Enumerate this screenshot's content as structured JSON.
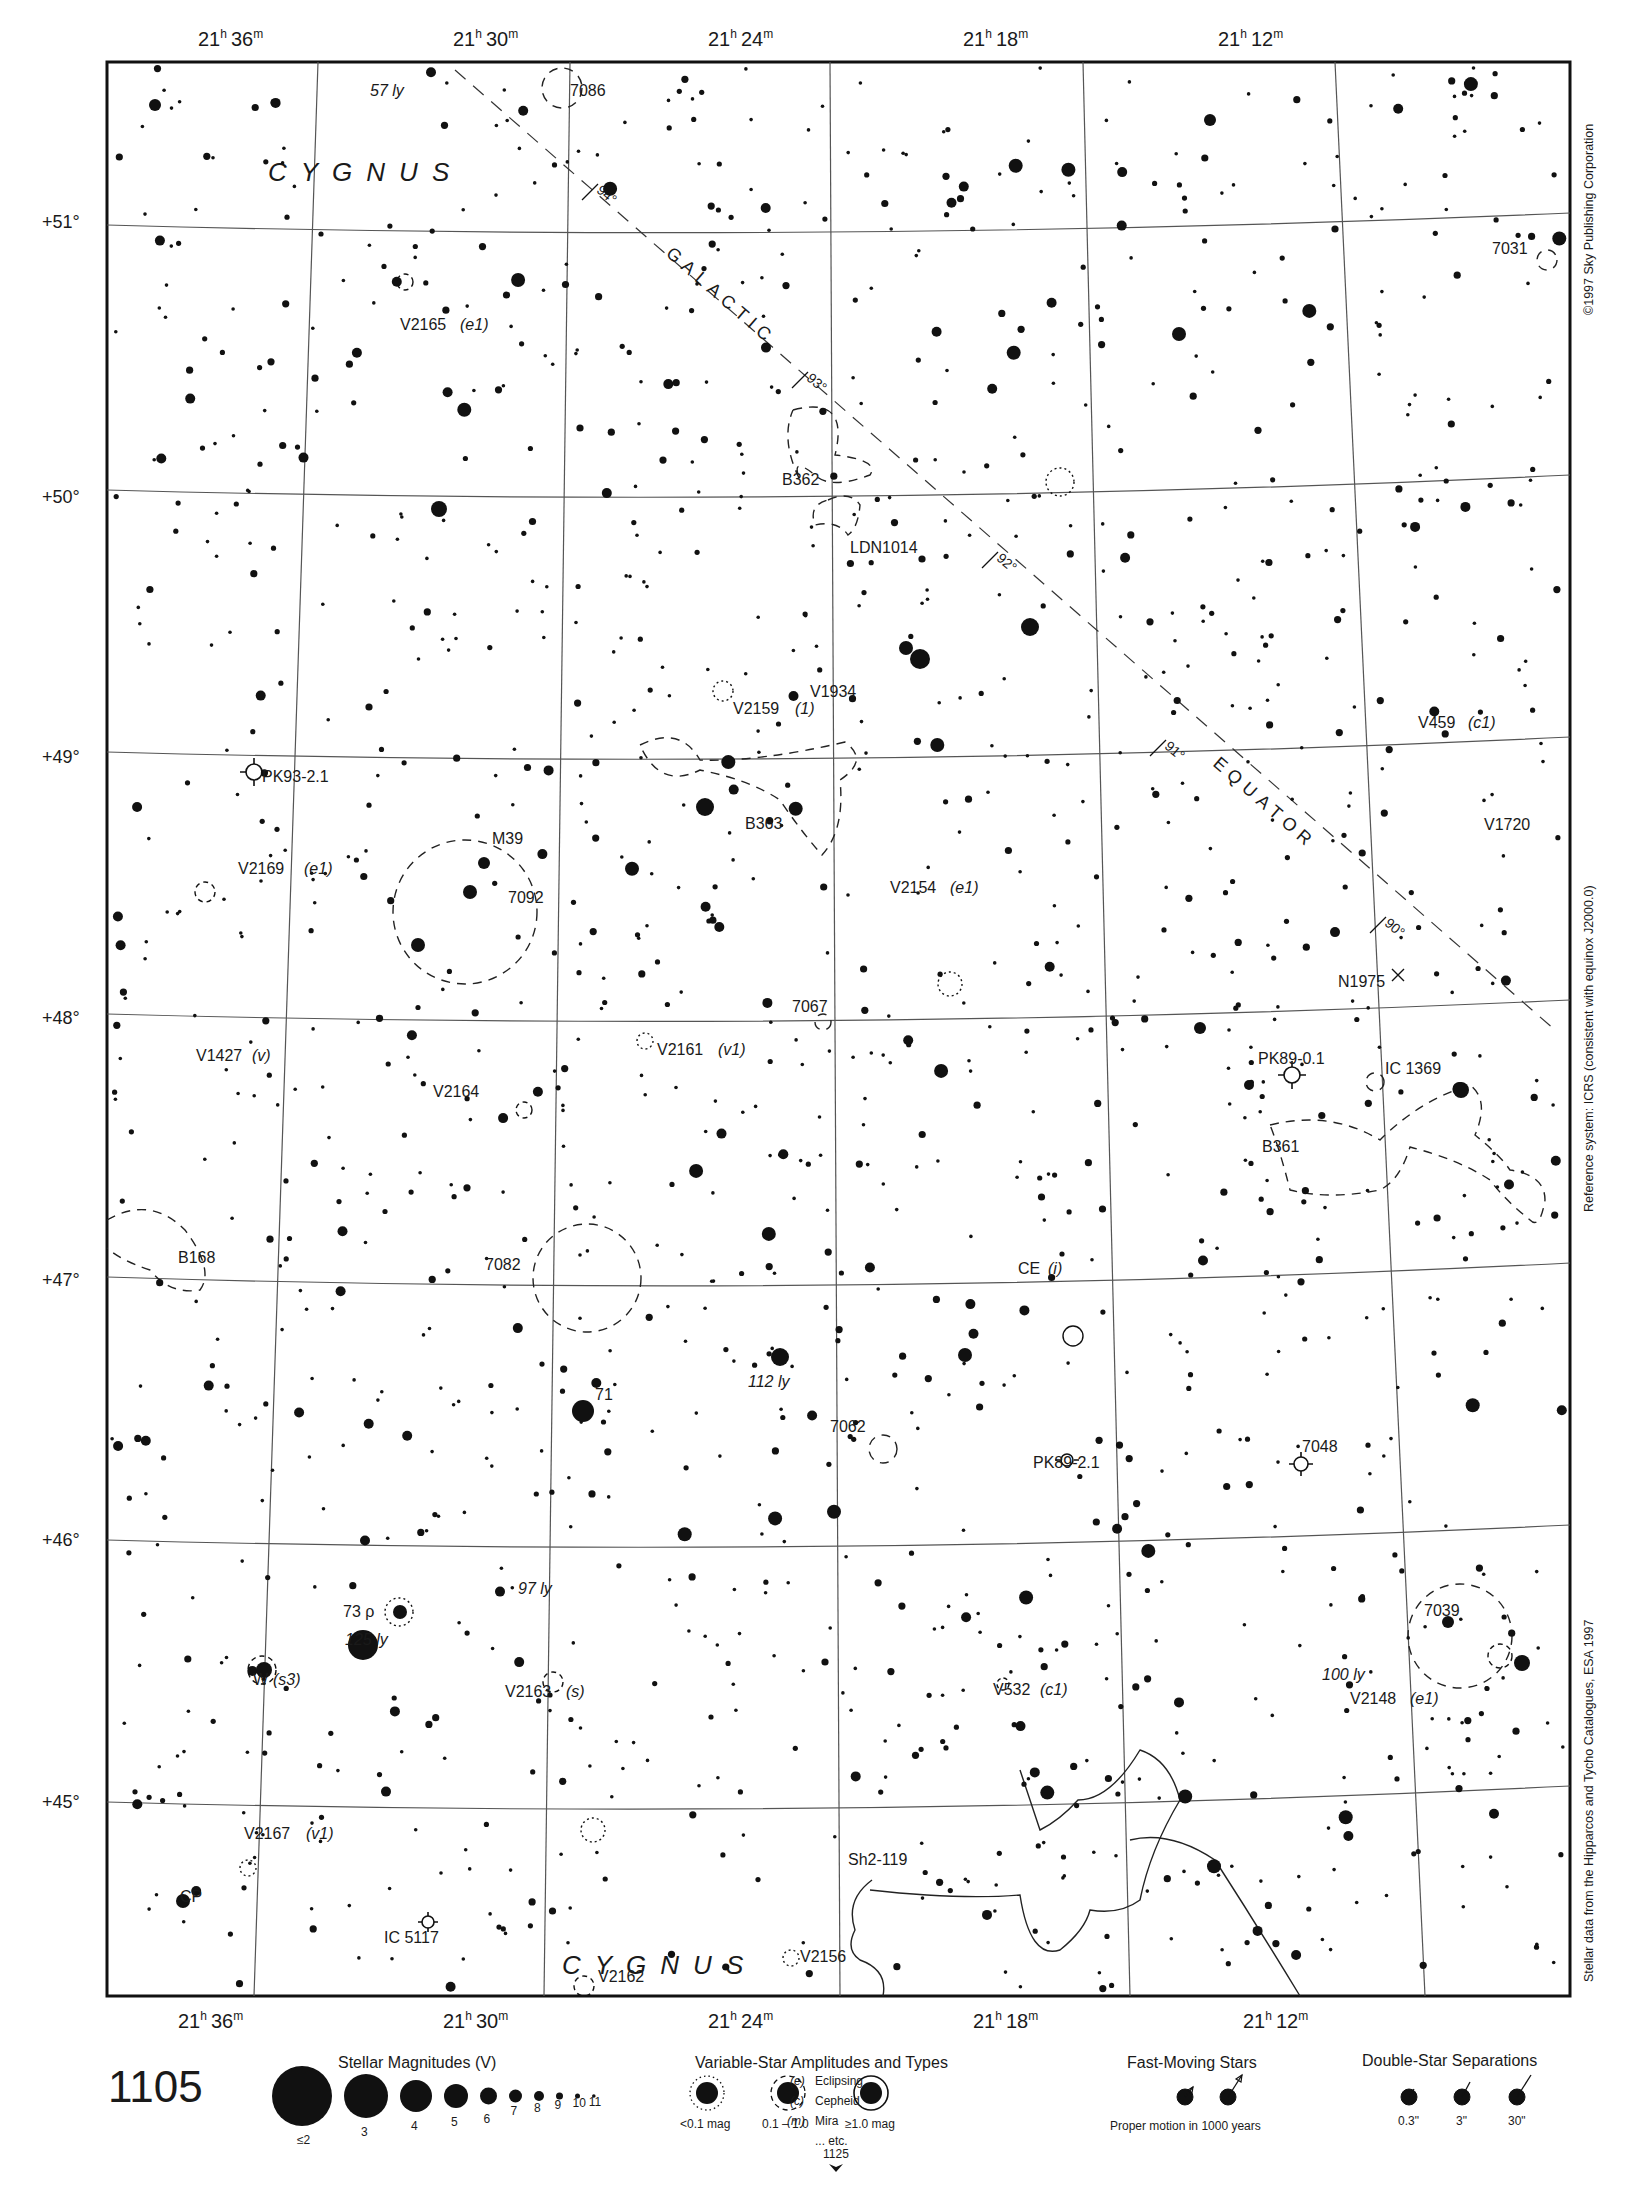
{
  "chart_info": {
    "page_number": "1105",
    "next_page_ref": "1125",
    "constellation": "CYGNUS",
    "galactic_label_1": "GALACTIC",
    "galactic_label_2": "EQUATOR",
    "copyright": "©1997 Sky Publishing Corporation",
    "reference_system": "Reference system: ICRS (consistent with equinox J2000.0)",
    "data_source": "Stellar data from the Hipparcos and Tycho Catalogues, ESA 1997"
  },
  "axes": {
    "ra_top": [
      {
        "label_h": "21",
        "label_m": "36",
        "x": 230
      },
      {
        "label_h": "21",
        "label_m": "30",
        "x": 485
      },
      {
        "label_h": "21",
        "label_m": "24",
        "x": 740
      },
      {
        "label_h": "21",
        "label_m": "18",
        "x": 995
      },
      {
        "label_h": "21",
        "label_m": "12",
        "x": 1250
      }
    ],
    "ra_bottom": [
      {
        "label_h": "21",
        "label_m": "36",
        "x": 210
      },
      {
        "label_h": "21",
        "label_m": "30",
        "x": 475
      },
      {
        "label_h": "21",
        "label_m": "24",
        "x": 740
      },
      {
        "label_h": "21",
        "label_m": "18",
        "x": 1005
      },
      {
        "label_h": "21",
        "label_m": "12",
        "x": 1275
      }
    ],
    "dec": [
      {
        "label": "+51°",
        "y": 222
      },
      {
        "label": "+50°",
        "y": 497
      },
      {
        "label": "+49°",
        "y": 757
      },
      {
        "label": "+48°",
        "y": 1018
      },
      {
        "label": "+47°",
        "y": 1280
      },
      {
        "label": "+46°",
        "y": 1540
      },
      {
        "label": "+45°",
        "y": 1802
      }
    ]
  },
  "labels": [
    {
      "id": "lbl-57ly",
      "text": "57 ly",
      "x": 370,
      "y": 96,
      "italic": true
    },
    {
      "id": "lbl-7086",
      "text": "7086",
      "x": 570,
      "y": 96
    },
    {
      "id": "lbl-v2165",
      "text": "V2165",
      "x": 400,
      "y": 330
    },
    {
      "id": "lbl-v2165-type",
      "text": "(e1)",
      "x": 460,
      "y": 330,
      "italic": true
    },
    {
      "id": "lbl-7031",
      "text": "7031",
      "x": 1492,
      "y": 254
    },
    {
      "id": "lbl-b362",
      "text": "B362",
      "x": 782,
      "y": 485
    },
    {
      "id": "lbl-ldn1014",
      "text": "LDN1014",
      "x": 850,
      "y": 553
    },
    {
      "id": "lbl-v1934",
      "text": "V1934",
      "x": 810,
      "y": 697
    },
    {
      "id": "lbl-v2159",
      "text": "V2159",
      "x": 733,
      "y": 714
    },
    {
      "id": "lbl-v2159-type",
      "text": "(1)",
      "x": 795,
      "y": 714,
      "italic": true
    },
    {
      "id": "lbl-v459",
      "text": "V459",
      "x": 1418,
      "y": 728
    },
    {
      "id": "lbl-v459-type",
      "text": "(c1)",
      "x": 1468,
      "y": 728,
      "italic": true
    },
    {
      "id": "lbl-pk93",
      "text": "PK93-2.1",
      "x": 262,
      "y": 782
    },
    {
      "id": "lbl-b363",
      "text": "B363",
      "x": 745,
      "y": 829
    },
    {
      "id": "lbl-v1720",
      "text": "V1720",
      "x": 1484,
      "y": 830
    },
    {
      "id": "lbl-m39",
      "text": "M39",
      "x": 492,
      "y": 844
    },
    {
      "id": "lbl-v2169",
      "text": "V2169",
      "x": 238,
      "y": 874
    },
    {
      "id": "lbl-v2169-type",
      "text": "(e1)",
      "x": 304,
      "y": 874,
      "italic": true
    },
    {
      "id": "lbl-7092",
      "text": "7092",
      "x": 508,
      "y": 903
    },
    {
      "id": "lbl-v2154",
      "text": "V2154",
      "x": 890,
      "y": 893
    },
    {
      "id": "lbl-v2154-type",
      "text": "(e1)",
      "x": 950,
      "y": 893,
      "italic": true
    },
    {
      "id": "lbl-n1975",
      "text": "N1975",
      "x": 1338,
      "y": 987
    },
    {
      "id": "lbl-7067",
      "text": "7067",
      "x": 792,
      "y": 1012
    },
    {
      "id": "lbl-v2161",
      "text": "V2161",
      "x": 657,
      "y": 1055
    },
    {
      "id": "lbl-v2161-type",
      "text": "(v1)",
      "x": 718,
      "y": 1055,
      "italic": true
    },
    {
      "id": "lbl-v1427",
      "text": "V1427",
      "x": 196,
      "y": 1061
    },
    {
      "id": "lbl-v1427-type",
      "text": "(v)",
      "x": 252,
      "y": 1061,
      "italic": true
    },
    {
      "id": "lbl-pk89-01",
      "text": "PK89-0.1",
      "x": 1258,
      "y": 1064
    },
    {
      "id": "lbl-ic1369",
      "text": "IC 1369",
      "x": 1385,
      "y": 1074
    },
    {
      "id": "lbl-v2164",
      "text": "V2164",
      "x": 433,
      "y": 1097
    },
    {
      "id": "lbl-b361",
      "text": "B361",
      "x": 1262,
      "y": 1152
    },
    {
      "id": "lbl-b168",
      "text": "B168",
      "x": 178,
      "y": 1263
    },
    {
      "id": "lbl-7082",
      "text": "7082",
      "x": 485,
      "y": 1270
    },
    {
      "id": "lbl-ce",
      "text": "CE",
      "x": 1018,
      "y": 1274
    },
    {
      "id": "lbl-ce-type",
      "text": "(i)",
      "x": 1048,
      "y": 1274,
      "italic": true
    },
    {
      "id": "lbl-112ly",
      "text": "112 ly",
      "x": 748,
      "y": 1387,
      "italic": true
    },
    {
      "id": "lbl-71",
      "text": "71",
      "x": 595,
      "y": 1400
    },
    {
      "id": "lbl-7062",
      "text": "7062",
      "x": 830,
      "y": 1432
    },
    {
      "id": "lbl-7048",
      "text": "7048",
      "x": 1302,
      "y": 1452
    },
    {
      "id": "lbl-pk89-21",
      "text": "PK89-2.1",
      "x": 1033,
      "y": 1468
    },
    {
      "id": "lbl-97ly",
      "text": "97 ly",
      "x": 518,
      "y": 1594,
      "italic": true
    },
    {
      "id": "lbl-7039",
      "text": "7039",
      "x": 1424,
      "y": 1616
    },
    {
      "id": "lbl-73rho",
      "text": "73 ρ",
      "x": 343,
      "y": 1617
    },
    {
      "id": "lbl-125ly",
      "text": "125 ly",
      "x": 345,
      "y": 1645,
      "italic": true
    },
    {
      "id": "lbl-100ly",
      "text": "100 ly",
      "x": 1322,
      "y": 1680,
      "italic": true
    },
    {
      "id": "lbl-w",
      "text": "W",
      "x": 253,
      "y": 1685
    },
    {
      "id": "lbl-w-type",
      "text": "(s3)",
      "x": 273,
      "y": 1685,
      "italic": true
    },
    {
      "id": "lbl-v2163",
      "text": "V2163",
      "x": 505,
      "y": 1697
    },
    {
      "id": "lbl-v2163-type",
      "text": "(s)",
      "x": 566,
      "y": 1697,
      "italic": true
    },
    {
      "id": "lbl-v532",
      "text": "V532",
      "x": 993,
      "y": 1695
    },
    {
      "id": "lbl-v532-type",
      "text": "(c1)",
      "x": 1040,
      "y": 1695,
      "italic": true
    },
    {
      "id": "lbl-v2148",
      "text": "V2148",
      "x": 1350,
      "y": 1704
    },
    {
      "id": "lbl-v2148-type",
      "text": "(e1)",
      "x": 1410,
      "y": 1704,
      "italic": true
    },
    {
      "id": "lbl-v2167",
      "text": "V2167",
      "x": 244,
      "y": 1839
    },
    {
      "id": "lbl-v2167-type",
      "text": "(v1)",
      "x": 306,
      "y": 1839,
      "italic": true
    },
    {
      "id": "lbl-sh2-119",
      "text": "Sh2-119",
      "x": 848,
      "y": 1865
    },
    {
      "id": "lbl-cp",
      "text": "CP",
      "x": 180,
      "y": 1902
    },
    {
      "id": "lbl-ic5117",
      "text": "IC 5117",
      "x": 384,
      "y": 1943
    },
    {
      "id": "lbl-v2156",
      "text": "V2156",
      "x": 800,
      "y": 1962
    },
    {
      "id": "lbl-v2162",
      "text": "V2162",
      "x": 598,
      "y": 1982
    }
  ],
  "galactic_ticks": [
    {
      "label": "94°",
      "x": 590,
      "y": 192
    },
    {
      "label": "93°",
      "x": 800,
      "y": 380
    },
    {
      "label": "92°",
      "x": 990,
      "y": 560
    },
    {
      "label": "91°",
      "x": 1158,
      "y": 748
    },
    {
      "label": "90°",
      "x": 1378,
      "y": 925
    }
  ],
  "legend": {
    "magnitudes": {
      "title": "Stellar Magnitudes (V)",
      "items": [
        {
          "label": "≤2",
          "r": 30
        },
        {
          "label": "3",
          "r": 22
        },
        {
          "label": "4",
          "r": 16
        },
        {
          "label": "5",
          "r": 12
        },
        {
          "label": "6",
          "r": 8.5
        },
        {
          "label": "7",
          "r": 6.5
        },
        {
          "label": "8",
          "r": 5
        },
        {
          "label": "9",
          "r": 3.5
        },
        {
          "label": "10",
          "r": 2.5
        },
        {
          "label": "11",
          "r": 1.8
        }
      ]
    },
    "variables": {
      "title": "Variable-Star Amplitudes and Types",
      "items": [
        {
          "label": "<0.1 mag",
          "style": "dotted"
        },
        {
          "label": "0.1 – 1.0",
          "style": "dashed"
        },
        {
          "label": "≥1.0 mag",
          "style": "solid"
        }
      ],
      "types": [
        {
          "code": "(e)",
          "name": "Eclipsing"
        },
        {
          "code": "(c)",
          "name": "Cepheid"
        },
        {
          "code": "(m)",
          "name": "Mira"
        },
        {
          "code": "",
          "name": "... etc."
        }
      ]
    },
    "fast_moving": {
      "title": "Fast-Moving Stars",
      "caption": "Proper motion in 1000 years"
    },
    "doubles": {
      "title": "Double-Star Separations",
      "items": [
        {
          "label": "0.3\""
        },
        {
          "label": "3\""
        },
        {
          "label": "30\""
        }
      ]
    }
  },
  "colors": {
    "ink": "#111111",
    "grid": "#555555",
    "background": "#ffffff"
  }
}
